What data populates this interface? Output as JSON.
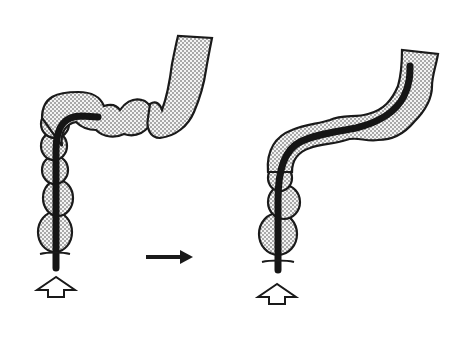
{
  "diagram": {
    "colors": {
      "background": "#ffffff",
      "outline": "#1a1a1a",
      "scope": "#151515",
      "stipple": "#3a3a3a",
      "lumen_fill": "#f2f2f2"
    },
    "panels": [
      {
        "id": "before",
        "label": "",
        "insertion_arrow": "hollow-up-arrow"
      },
      {
        "id": "after",
        "label": "",
        "insertion_arrow": "hollow-up-arrow"
      }
    ],
    "transition_arrow": {
      "icon": "right-arrow",
      "direction": "right"
    }
  }
}
